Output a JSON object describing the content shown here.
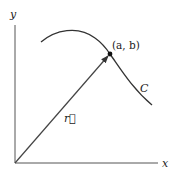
{
  "diagram": {
    "axes": {
      "x_label": "x",
      "y_label": "y"
    },
    "vector": {
      "label": "r⃗",
      "from": "origin",
      "to": "(a, b)"
    },
    "point": {
      "label": "(a, b)"
    },
    "curve": {
      "label": "C"
    },
    "colors": {
      "stroke": "#333333",
      "background": "#ffffff"
    }
  }
}
